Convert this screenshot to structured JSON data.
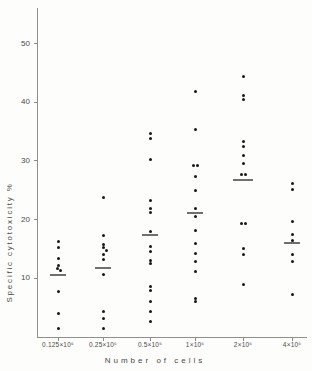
{
  "chart_data": {
    "type": "scatter",
    "title": "",
    "xlabel": "Number of cells",
    "ylabel": "Specific cytotoxicity %",
    "ylim": [
      0,
      55
    ],
    "yticks": [
      10,
      20,
      30,
      40,
      50
    ],
    "grid": false,
    "legend": "none",
    "categories": [
      "0.125×10⁶",
      "0.25×10⁶",
      "0.5×10⁶",
      "1×10⁶",
      "2×10⁶",
      "4×10⁶"
    ],
    "point_note": "points are [value_percent, horizontal_jitter_px]; mean is the horizontal bar per column",
    "series": [
      {
        "category": "0.125×10⁶",
        "mean": 10.5,
        "points": [
          [
            16.3,
            0
          ],
          [
            15.2,
            0
          ],
          [
            13.3,
            0
          ],
          [
            12.2,
            0
          ],
          [
            11.6,
            -1
          ],
          [
            11.3,
            2
          ],
          [
            7.7,
            0
          ],
          [
            4.0,
            0
          ],
          [
            1.5,
            0
          ]
        ]
      },
      {
        "category": "0.25×10⁶",
        "mean": 11.7,
        "points": [
          [
            23.7,
            0
          ],
          [
            17.3,
            0
          ],
          [
            15.7,
            0
          ],
          [
            15.2,
            0
          ],
          [
            14.7,
            3
          ],
          [
            14.0,
            0
          ],
          [
            13.2,
            0
          ],
          [
            10.7,
            0
          ],
          [
            4.3,
            0
          ],
          [
            3.2,
            0
          ],
          [
            1.5,
            0
          ]
        ]
      },
      {
        "category": "0.5×10⁶",
        "mean": 17.3,
        "points": [
          [
            34.7,
            0
          ],
          [
            33.8,
            0
          ],
          [
            30.2,
            0
          ],
          [
            23.3,
            0
          ],
          [
            21.9,
            0
          ],
          [
            21.2,
            0
          ],
          [
            17.9,
            0
          ],
          [
            15.4,
            0
          ],
          [
            14.5,
            0
          ],
          [
            13.1,
            0
          ],
          [
            12.6,
            0
          ],
          [
            8.6,
            0
          ],
          [
            8.0,
            0
          ],
          [
            6.0,
            0
          ],
          [
            4.3,
            0
          ],
          [
            2.6,
            0
          ]
        ]
      },
      {
        "category": "1×10⁶",
        "mean": 21.2,
        "points": [
          [
            41.8,
            0
          ],
          [
            35.3,
            0
          ],
          [
            29.3,
            -2
          ],
          [
            29.3,
            2
          ],
          [
            27.3,
            0
          ],
          [
            25.0,
            0
          ],
          [
            21.9,
            0
          ],
          [
            20.5,
            0
          ],
          [
            18.2,
            0
          ],
          [
            16.0,
            0
          ],
          [
            14.3,
            0
          ],
          [
            12.8,
            0
          ],
          [
            11.1,
            0
          ],
          [
            6.6,
            0
          ],
          [
            6.0,
            0
          ]
        ]
      },
      {
        "category": "2×10⁶",
        "mean": 26.8,
        "points": [
          [
            44.3,
            0
          ],
          [
            41.2,
            0
          ],
          [
            40.5,
            0
          ],
          [
            33.3,
            0
          ],
          [
            32.5,
            0
          ],
          [
            31.0,
            0
          ],
          [
            29.6,
            0
          ],
          [
            27.6,
            -2
          ],
          [
            27.6,
            2
          ],
          [
            19.4,
            -2
          ],
          [
            19.4,
            2
          ],
          [
            15.1,
            0
          ],
          [
            14.0,
            0
          ],
          [
            9.0,
            0
          ]
        ]
      },
      {
        "category": "4×10⁶",
        "mean": 16.0,
        "points": [
          [
            26.2,
            0
          ],
          [
            25.2,
            0
          ],
          [
            19.6,
            0
          ],
          [
            17.4,
            0
          ],
          [
            16.5,
            0
          ],
          [
            14.0,
            0
          ],
          [
            12.8,
            0
          ],
          [
            7.2,
            0
          ]
        ]
      }
    ]
  }
}
